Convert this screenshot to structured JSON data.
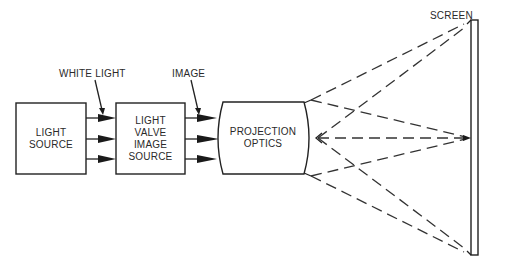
{
  "diagram": {
    "type": "block-diagram",
    "blocks": [
      {
        "id": "light-source",
        "lines": [
          "LIGHT",
          "SOURCE"
        ]
      },
      {
        "id": "light-valve",
        "lines": [
          "LIGHT",
          "VALVE",
          "IMAGE",
          "SOURCE"
        ]
      },
      {
        "id": "projection-optics",
        "lines": [
          "PROJECTION",
          "OPTICS"
        ]
      }
    ],
    "callouts": {
      "white_light": "WHITE LIGHT",
      "image": "IMAGE",
      "screen": "SCREEN"
    },
    "connections": [
      {
        "from": "light-source",
        "to": "light-valve",
        "arrows": 3,
        "label": "WHITE LIGHT"
      },
      {
        "from": "light-valve",
        "to": "projection-optics",
        "arrows": 3,
        "label": "IMAGE"
      },
      {
        "from": "projection-optics",
        "to": "screen",
        "style": "dashed-rays",
        "label": "projected light rays"
      }
    ],
    "colors": {
      "line": "#222222",
      "background": "#ffffff"
    }
  }
}
